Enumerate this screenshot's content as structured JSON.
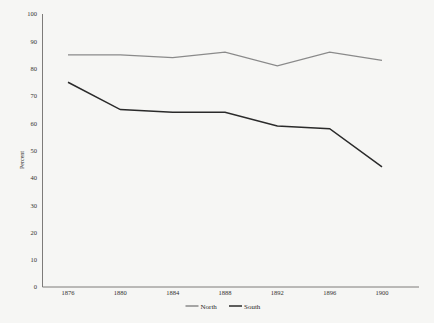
{
  "chart_data": {
    "type": "line",
    "title": "",
    "subtitle": "",
    "xlabel": "",
    "ylabel": "Percent",
    "x": [
      1876,
      1880,
      1884,
      1888,
      1892,
      1896,
      1900
    ],
    "xticklabels": [
      "1876",
      "1880",
      "1884",
      "1888",
      "1892",
      "1896",
      "1900"
    ],
    "yticks": [
      0,
      10,
      20,
      30,
      40,
      50,
      60,
      70,
      80,
      90,
      100
    ],
    "yticklabels": [
      "0",
      "10",
      "20",
      "30",
      "40",
      "50",
      "60",
      "70",
      "80",
      "90",
      "100"
    ],
    "ylim": [
      0,
      100
    ],
    "xlim": [
      1876,
      1900
    ],
    "grid": false,
    "legend_position": "bottom",
    "series": [
      {
        "name": "North",
        "color": "#8a8a8a",
        "values": [
          85,
          85,
          84,
          86,
          81,
          86,
          83
        ]
      },
      {
        "name": "South",
        "color": "#2a2a2a",
        "values": [
          75,
          65,
          64,
          64,
          59,
          58,
          44
        ]
      }
    ]
  },
  "legend": {
    "items": [
      {
        "label": "North",
        "color": "#8a8a8a"
      },
      {
        "label": "South",
        "color": "#2a2a2a"
      }
    ]
  },
  "axes": {
    "y_title": "Percent",
    "axis_color": "#6f6d6b"
  },
  "colors": {
    "background": "#f6f6f4",
    "north": "#8a8a8a",
    "south": "#2a2a2a",
    "text": "#33312f"
  }
}
